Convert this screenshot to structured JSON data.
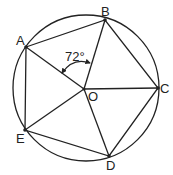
{
  "diagram": {
    "type": "regular pentagon inscribed in circle",
    "circle": {
      "cx": 86,
      "cy": 88,
      "r": 73
    },
    "center": {
      "label": "O",
      "x": 84,
      "y": 89
    },
    "vertices": [
      {
        "label": "A",
        "x": 26,
        "y": 47
      },
      {
        "label": "B",
        "x": 105,
        "y": 20
      },
      {
        "label": "C",
        "x": 158,
        "y": 88
      },
      {
        "label": "D",
        "x": 109,
        "y": 156
      },
      {
        "label": "E",
        "x": 25,
        "y": 130
      }
    ],
    "angle_annotation": {
      "text": "72°",
      "between": [
        "OA",
        "OB"
      ]
    },
    "stroke_color": "#222222"
  }
}
